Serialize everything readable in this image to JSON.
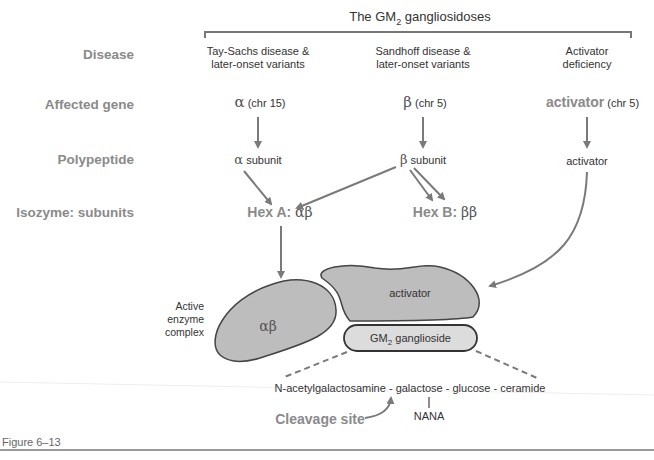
{
  "title": {
    "prefix": "The GM",
    "sub": "2",
    "suffix": " gangliosidoses"
  },
  "row_labels": {
    "disease": "Disease",
    "affected_gene": "Affected gene",
    "polypeptide": "Polypeptide",
    "isozyme": "Isozyme: subunits"
  },
  "diseases": [
    {
      "line1": "Tay-Sachs disease &",
      "line2": "later-onset variants"
    },
    {
      "line1": "Sandhoff disease &",
      "line2": "later-onset variants"
    },
    {
      "line1": "Activator",
      "line2": "deficiency"
    }
  ],
  "genes": [
    {
      "symbol": "α",
      "chr": " (chr 15)"
    },
    {
      "symbol": "β",
      "chr": " (chr 5)"
    },
    {
      "symbol": "activator",
      "chr": " (chr 5)"
    }
  ],
  "polypeptides": [
    {
      "symbol": "α",
      "label": " subunit"
    },
    {
      "symbol": "β",
      "label": " subunit"
    },
    {
      "symbol": "",
      "label": "activator"
    }
  ],
  "isozymes": [
    {
      "name": "Hex A: ",
      "subunits": "αβ"
    },
    {
      "name": "Hex B: ",
      "subunits": "ββ"
    }
  ],
  "complex": {
    "label_line1": "Active",
    "label_line2": "enzyme",
    "label_line3": "complex",
    "enzyme": "αβ",
    "activator": "activator",
    "ganglioside_prefix": "GM",
    "ganglioside_sub": "2",
    "ganglioside_suffix": " ganglioside"
  },
  "chain": {
    "text": "N-acetylgalactosamine - galactose - glucose - ceramide",
    "branch": "NANA",
    "cleavage": "Cleavage site"
  },
  "figure_label": "Figure 6–13",
  "colors": {
    "arrow": "#7a7a7a",
    "shape_fill": "#bdbdbd",
    "ganglioside_fill": "#dcdcdc",
    "outline": "#444444",
    "label_grey": "#8a8a8a"
  }
}
